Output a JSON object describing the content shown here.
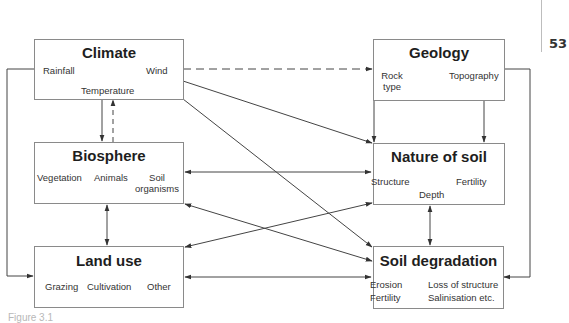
{
  "page": {
    "number": "53",
    "caption": "Figure 3.1"
  },
  "nodes": {
    "climate": {
      "title": "Climate",
      "items": [
        "Rainfall",
        "Wind",
        "Temperature"
      ]
    },
    "geology": {
      "title": "Geology",
      "items": [
        "Rock type",
        "Topography"
      ],
      "rock_line1": "Rock",
      "rock_line2": "type"
    },
    "biosphere": {
      "title": "Biosphere",
      "items": [
        "Vegetation",
        "Animals",
        "Soil organisms"
      ],
      "soil_line1": "Soil",
      "soil_line2": "organisms"
    },
    "nature_of_soil": {
      "title": "Nature of soil",
      "items": [
        "Structure",
        "Fertility",
        "Depth"
      ]
    },
    "land_use": {
      "title": "Land use",
      "items": [
        "Grazing",
        "Cultivation",
        "Other"
      ]
    },
    "soil_degradation": {
      "title": "Soil degradation",
      "items": [
        "Erosion",
        "Loss of structure",
        "Fertility",
        "Salinisation etc."
      ]
    }
  },
  "edges": [
    {
      "from": "Climate",
      "to": "Geology",
      "style": "dashed",
      "direction": "forward"
    },
    {
      "from": "Climate",
      "to": "Biosphere",
      "style": "solid",
      "direction": "forward"
    },
    {
      "from": "Biosphere",
      "to": "Climate",
      "style": "dashed",
      "direction": "forward"
    },
    {
      "from": "Climate",
      "to": "Nature of soil",
      "style": "solid",
      "direction": "forward"
    },
    {
      "from": "Climate",
      "to": "Soil degradation",
      "style": "solid",
      "direction": "forward"
    },
    {
      "from": "Climate",
      "to": "Land use",
      "style": "solid",
      "direction": "forward"
    },
    {
      "from": "Geology",
      "to": "Nature of soil",
      "style": "solid",
      "direction": "forward",
      "count": 2
    },
    {
      "from": "Geology",
      "to": "Soil degradation",
      "style": "solid",
      "direction": "forward"
    },
    {
      "from": "Biosphere",
      "to": "Nature of soil",
      "style": "solid",
      "direction": "both"
    },
    {
      "from": "Biosphere",
      "to": "Land use",
      "style": "solid",
      "direction": "both"
    },
    {
      "from": "Biosphere",
      "to": "Soil degradation",
      "style": "solid",
      "direction": "both"
    },
    {
      "from": "Nature of soil",
      "to": "Land use",
      "style": "solid",
      "direction": "both"
    },
    {
      "from": "Nature of soil",
      "to": "Soil degradation",
      "style": "solid",
      "direction": "both"
    },
    {
      "from": "Land use",
      "to": "Soil degradation",
      "style": "solid",
      "direction": "both"
    }
  ]
}
